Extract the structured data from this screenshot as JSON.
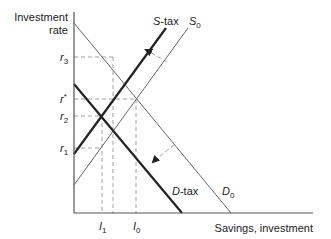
{
  "diagram": {
    "y_axis_label_line1": "Investment",
    "y_axis_label_line2": "rate",
    "x_axis_label": "Savings, investment",
    "curves": {
      "s_tax": {
        "base": "S",
        "suffix": "-tax"
      },
      "s_0": {
        "base": "S",
        "sub": "0"
      },
      "d_tax": {
        "base": "D",
        "suffix": "-tax"
      },
      "d_0": {
        "base": "D",
        "sub": "0"
      }
    },
    "y_ticks": {
      "r3": {
        "base": "r",
        "sub": "3"
      },
      "r_star": {
        "base": "r",
        "sup": "*"
      },
      "r2": {
        "base": "r",
        "sub": "2"
      },
      "r1": {
        "base": "r",
        "sub": "1"
      }
    },
    "x_ticks": {
      "i1": {
        "base": "I",
        "sub": "1"
      },
      "i0": {
        "base": "I",
        "sub": "0"
      }
    },
    "colors": {
      "axis": "#555555",
      "thin_line": "#666666",
      "thick_line": "#222222",
      "dashed": "#888888"
    }
  }
}
